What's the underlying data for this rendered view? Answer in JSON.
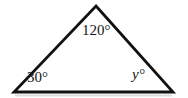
{
  "figure": {
    "kind": "geometry-diagram",
    "shape": "triangle",
    "background_color": "#ffffff",
    "stroke_color": "#111111",
    "stroke_width": 2.8,
    "text_color": "#161616",
    "shadow_color": "#d8d8d8",
    "vertices": {
      "apex": {
        "x": 96,
        "y": 6
      },
      "bottom_left": {
        "x": 14,
        "y": 92
      },
      "bottom_right": {
        "x": 173,
        "y": 92
      }
    },
    "angles": [
      {
        "id": "apex-angle",
        "vertex": "apex",
        "value": "120",
        "unit": "°",
        "text": "120°",
        "style": "upright",
        "known": true
      },
      {
        "id": "bottom-left-angle",
        "vertex": "bottom_left",
        "value": "30",
        "unit": "°",
        "text": "30°",
        "style": "upright",
        "known": true
      },
      {
        "id": "bottom-right-angle",
        "vertex": "bottom_right",
        "value": "y",
        "unit": "°",
        "text": "y°",
        "style": "italic",
        "known": false
      }
    ]
  },
  "labels": {
    "apex": "120°",
    "bottom_left": "30°",
    "bottom_right": "y°"
  }
}
